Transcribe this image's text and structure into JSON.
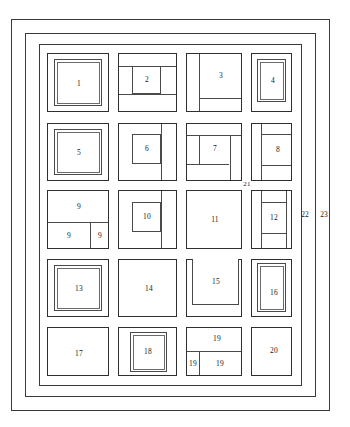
{
  "figure": {
    "type": "block-plan-diagram",
    "style": "patent-line-drawing",
    "stroke_color": "#2f2f2f",
    "background_color": "#ffffff"
  },
  "frames": [
    {
      "name": "outer-frame",
      "label": "23"
    },
    {
      "name": "middle-frame",
      "label": "22"
    },
    {
      "name": "inner-frame",
      "label": ""
    }
  ],
  "outer_labels": [
    {
      "id": "label-22",
      "text": "22"
    },
    {
      "id": "label-23",
      "text": "23"
    },
    {
      "id": "label-21",
      "text": "21"
    }
  ],
  "blocks": [
    {
      "id": 1,
      "label": "1",
      "shape": "nested-square"
    },
    {
      "id": 2,
      "label": "2",
      "shape": "banded-with-center-box"
    },
    {
      "id": 3,
      "label": "3",
      "shape": "bottom-band"
    },
    {
      "id": 4,
      "label": "4",
      "shape": "nested-square"
    },
    {
      "id": 5,
      "label": "5",
      "shape": "nested-square"
    },
    {
      "id": 6,
      "label": "6",
      "shape": "three-band-stack"
    },
    {
      "id": 7,
      "label": "7",
      "shape": "banded-with-center-box"
    },
    {
      "id": 8,
      "label": "8",
      "shape": "three-band-stack"
    },
    {
      "id": 9,
      "label": "9",
      "shape": "split-top-and-two-bottom"
    },
    {
      "id": 10,
      "label": "10",
      "shape": "three-band-stack"
    },
    {
      "id": 11,
      "label": "11",
      "shape": "open"
    },
    {
      "id": 12,
      "label": "12",
      "shape": "three-band-stack"
    },
    {
      "id": 13,
      "label": "13",
      "shape": "nested-square"
    },
    {
      "id": 14,
      "label": "14",
      "shape": "open"
    },
    {
      "id": 15,
      "label": "15",
      "shape": "open-top-box"
    },
    {
      "id": 16,
      "label": "16",
      "shape": "nested-square"
    },
    {
      "id": 17,
      "label": "17",
      "shape": "open"
    },
    {
      "id": 18,
      "label": "18",
      "shape": "nested-square"
    },
    {
      "id": 19,
      "label": "19",
      "shape": "split-top-and-two-bottom"
    },
    {
      "id": 20,
      "label": "20",
      "shape": "open"
    }
  ],
  "sub_labels": {
    "block9_top": "9",
    "block9_left": "9",
    "block9_right": "9",
    "block19_top": "19",
    "block19_left": "19",
    "block19_right": "19"
  }
}
